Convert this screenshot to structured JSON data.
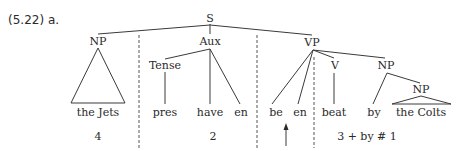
{
  "example": {
    "label": "(5.22) a."
  },
  "tree": {
    "root": "S",
    "nodes": {
      "s": "S",
      "np_subject": "NP",
      "aux": "Aux",
      "vp": "VP",
      "tense": "Tense",
      "v": "V",
      "np_object": "NP",
      "np_inner": "NP"
    },
    "leaves": {
      "the_jets": "the Jets",
      "pres": "pres",
      "have": "have",
      "en1": "en",
      "be": "be",
      "en2": "en",
      "beat": "beat",
      "by": "by",
      "the_colts": "the Colts"
    }
  },
  "segments": {
    "seg1": "4",
    "seg2": "2",
    "seg3": "3 + by # 1"
  }
}
